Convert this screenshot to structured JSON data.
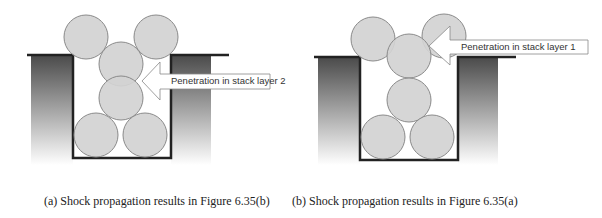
{
  "panels": [
    {
      "id": "a",
      "arrow_label": "Penetration in stack layer 2",
      "caption": "(a) Shock propagation results in Figure 6.35(b)"
    },
    {
      "id": "b",
      "arrow_label": "Penetration in stack layer 1",
      "caption": "(b) Shock propagation results in Figure 6.35(a)"
    }
  ],
  "colors": {
    "ball_fill": "#d3d3d3",
    "ball_stroke": "#8a8a8a",
    "wall_dark": "#555555",
    "container_line": "#222222"
  }
}
